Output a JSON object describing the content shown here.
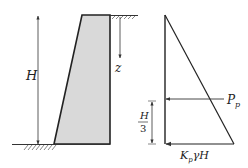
{
  "diagram": {
    "type": "retaining-wall-passive-earth-pressure",
    "colors": {
      "wall_fill": "#d9d9d9",
      "wall_stroke": "#222222",
      "line": "#333333"
    },
    "labels": {
      "height": "H",
      "depth": "z",
      "resultant": "P",
      "resultant_sub": "p",
      "third_num": "H",
      "third_den": "3",
      "base_pressure_k": "K",
      "base_pressure_sub": "p",
      "base_pressure_rest": "γH"
    }
  }
}
